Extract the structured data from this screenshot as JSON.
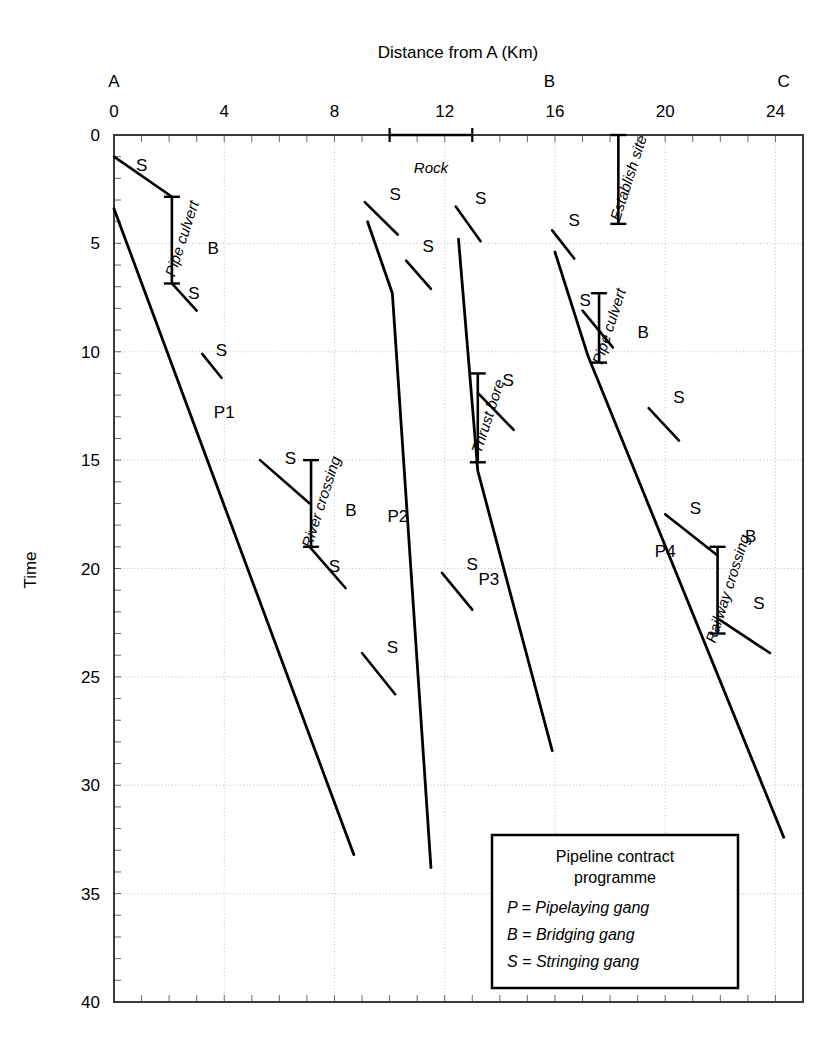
{
  "figure": {
    "xlabel": "Distance from A (Km)",
    "ylabel": "Time"
  },
  "legend": {
    "title_line1": "Pipeline contract",
    "title_line2": "programme",
    "items": [
      "P = Pipelaying gang",
      "B = Bridging gang",
      "S = Stringing gang"
    ]
  },
  "chart_data": {
    "type": "line",
    "title": "Pipeline contract programme",
    "xlabel": "Distance from A (Km)",
    "ylabel": "Time",
    "xlim": [
      0,
      25
    ],
    "ylim": [
      0,
      40
    ],
    "y_inverted": true,
    "grid": true,
    "legend_position": "inset-bottom-right",
    "x_ticks": [
      0,
      4,
      8,
      12,
      16,
      20,
      24
    ],
    "x_tick_labels": [
      "0",
      "4",
      "8",
      "12",
      "16",
      "20",
      "24"
    ],
    "x_minor_tick_step": 1,
    "y_ticks": [
      0,
      5,
      10,
      15,
      20,
      25,
      30,
      35,
      40
    ],
    "y_tick_labels": [
      "0",
      "5",
      "10",
      "15",
      "20",
      "25",
      "30",
      "35",
      "40"
    ],
    "y_minor_tick_step": 1,
    "node_markers": [
      {
        "label": "A",
        "x": 0
      },
      {
        "label": "B",
        "x": 15.8
      },
      {
        "label": "C",
        "x": 24.3
      }
    ],
    "series": [
      {
        "name": "P1",
        "gang": "Pipelaying gang",
        "label": "P1",
        "label_x": 4.0,
        "label_y": 12.8,
        "points": [
          [
            0,
            3.4
          ],
          [
            8.7,
            33.2
          ]
        ]
      },
      {
        "name": "P2",
        "gang": "Pipelaying gang",
        "label": "P2",
        "label_x": 10.3,
        "label_y": 17.6,
        "points": [
          [
            9.2,
            4.0
          ],
          [
            10.1,
            7.3
          ],
          [
            11.5,
            33.8
          ]
        ]
      },
      {
        "name": "P3",
        "gang": "Pipelaying gang",
        "label": "P3",
        "label_x": 13.6,
        "label_y": 20.5,
        "points": [
          [
            12.5,
            4.8
          ],
          [
            13.2,
            15.5
          ],
          [
            15.9,
            28.4
          ]
        ]
      },
      {
        "name": "P4",
        "gang": "Pipelaying gang",
        "label": "P4",
        "label_x": 20.0,
        "label_y": 19.2,
        "points": [
          [
            16.0,
            5.4
          ],
          [
            17.2,
            10.2
          ],
          [
            24.3,
            32.4
          ]
        ]
      }
    ],
    "stringing_runs": [
      {
        "label": "S",
        "points": [
          [
            0.0,
            1.0
          ],
          [
            2.1,
            2.85
          ]
        ],
        "label_x": 1.0,
        "label_y": 1.4
      },
      {
        "label": "S",
        "points": [
          [
            2.1,
            6.85
          ],
          [
            3.0,
            8.1
          ]
        ],
        "label_x": 2.9,
        "label_y": 7.3
      },
      {
        "label": "S",
        "points": [
          [
            3.2,
            10.1
          ],
          [
            3.9,
            11.2
          ]
        ],
        "label_x": 3.9,
        "label_y": 9.9
      },
      {
        "label": "S",
        "points": [
          [
            5.3,
            15.0
          ],
          [
            7.1,
            17.0
          ]
        ],
        "label_x": 6.4,
        "label_y": 14.9
      },
      {
        "label": "S",
        "points": [
          [
            7.1,
            19.0
          ],
          [
            8.4,
            20.9
          ]
        ],
        "label_x": 8.0,
        "label_y": 19.9
      },
      {
        "label": "S",
        "points": [
          [
            9.0,
            23.9
          ],
          [
            10.2,
            25.8
          ]
        ],
        "label_x": 10.1,
        "label_y": 23.6
      },
      {
        "label": "S",
        "points": [
          [
            9.1,
            3.1
          ],
          [
            10.3,
            4.6
          ]
        ],
        "label_x": 10.2,
        "label_y": 2.7
      },
      {
        "label": "S",
        "points": [
          [
            10.6,
            5.8
          ],
          [
            11.5,
            7.1
          ]
        ],
        "label_x": 11.4,
        "label_y": 5.1
      },
      {
        "label": "S",
        "points": [
          [
            12.4,
            3.3
          ],
          [
            13.3,
            4.9
          ]
        ],
        "label_x": 13.3,
        "label_y": 2.9
      },
      {
        "label": "S",
        "points": [
          [
            13.2,
            11.9
          ],
          [
            14.5,
            13.6
          ]
        ],
        "label_x": 14.3,
        "label_y": 11.3
      },
      {
        "label": "S",
        "points": [
          [
            11.9,
            20.2
          ],
          [
            13.0,
            21.9
          ]
        ],
        "label_x": 13.0,
        "label_y": 19.8
      },
      {
        "label": "S",
        "points": [
          [
            15.9,
            4.4
          ],
          [
            16.7,
            5.7
          ]
        ],
        "label_x": 16.7,
        "label_y": 3.9
      },
      {
        "label": "S",
        "points": [
          [
            17.0,
            8.1
          ],
          [
            18.1,
            9.8
          ]
        ],
        "label_x": 17.1,
        "label_y": 7.6
      },
      {
        "label": "S",
        "points": [
          [
            19.4,
            12.6
          ],
          [
            20.5,
            14.1
          ]
        ],
        "label_x": 20.5,
        "label_y": 12.1
      },
      {
        "label": "S",
        "points": [
          [
            20.0,
            17.5
          ],
          [
            21.9,
            19.4
          ]
        ],
        "label_x": 21.1,
        "label_y": 17.2
      },
      {
        "label": "S",
        "points": [
          [
            21.9,
            22.3
          ],
          [
            23.8,
            23.9
          ]
        ],
        "label_x": 23.4,
        "label_y": 21.6
      }
    ],
    "bridging_activities": [
      {
        "name": "Pipe culvert",
        "label": "Pipe culvert",
        "gang_label": "B",
        "x": 2.1,
        "t_start": 2.85,
        "t_end": 6.85,
        "gang_x": 3.6,
        "gang_y": 5.2
      },
      {
        "name": "River crossing",
        "label": "River crossing",
        "gang_label": "B",
        "x": 7.15,
        "t_start": 15.0,
        "t_end": 19.0,
        "gang_x": 8.6,
        "gang_y": 17.3
      },
      {
        "name": "Thrust bore",
        "label": "Thrust bore",
        "gang_label": "",
        "x": 13.2,
        "t_start": 11.0,
        "t_end": 15.1,
        "gang_x": null,
        "gang_y": null
      },
      {
        "name": "Pipe culvert",
        "label": "Pipe culvert",
        "gang_label": "B",
        "x": 17.6,
        "t_start": 7.3,
        "t_end": 10.5,
        "gang_x": 19.2,
        "gang_y": 9.1
      },
      {
        "name": "Railway crossing",
        "label": "Railway crossing",
        "gang_label": "B",
        "x": 21.9,
        "t_start": 19.0,
        "t_end": 23.0,
        "gang_x": 23.1,
        "gang_y": 18.5
      },
      {
        "name": "Establish site",
        "label": "Establish site",
        "gang_label": "",
        "x": 18.3,
        "t_start": 0.0,
        "t_end": 4.1,
        "gang_x": null,
        "gang_y": null
      }
    ],
    "span_annotations": [
      {
        "label": "Rock",
        "x_start": 10.0,
        "x_end": 13.0,
        "t": 0.0,
        "label_x": 11.5,
        "label_y": 1.5
      }
    ]
  }
}
